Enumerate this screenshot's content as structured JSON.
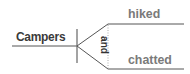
{
  "diagram": {
    "type": "sentence-diagram",
    "subject": "Campers",
    "conjunction": "and",
    "predicates": [
      "hiked",
      "chatted"
    ],
    "colors": {
      "lines": "#555555",
      "subject_text": "#3a3a3a",
      "predicate_text": "#7a7a7a",
      "conjunction_text": "#333333",
      "dotted_line": "#aaaaaa"
    }
  }
}
